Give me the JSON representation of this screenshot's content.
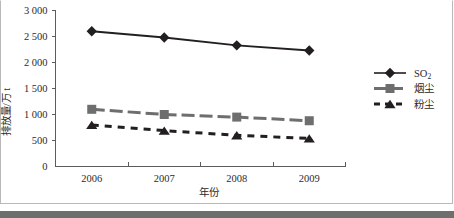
{
  "chart_data": {
    "type": "line",
    "title": "",
    "xlabel": "年份",
    "ylabel": "排放量/万 t",
    "categories": [
      "2006",
      "2007",
      "2008",
      "2009"
    ],
    "ylim": [
      0,
      3000
    ],
    "ytick_labels": [
      "0",
      "500",
      "1 000",
      "1 500",
      "2 000",
      "2 500",
      "3 000"
    ],
    "ytick_values": [
      0,
      500,
      1000,
      1500,
      2000,
      2500,
      3000
    ],
    "grid": false,
    "legend_position": "right",
    "series": [
      {
        "name": "SO2",
        "label": "SO",
        "subscript": "2",
        "marker": "diamond",
        "line_style": "solid",
        "color": "#231f20",
        "values": [
          2600,
          2480,
          2330,
          2230
        ]
      },
      {
        "name": "烟尘",
        "label": "烟尘",
        "subscript": "",
        "marker": "square",
        "line_style": "dashed",
        "color": "#6e6e6e",
        "values": [
          1100,
          1000,
          950,
          880
        ]
      },
      {
        "name": "粉尘",
        "label": "粉尘",
        "subscript": "",
        "marker": "triangle",
        "line_style": "dotted",
        "color": "#231f20",
        "values": [
          800,
          690,
          600,
          540
        ]
      }
    ]
  },
  "colors": {
    "axis": "#5c5c5c",
    "text": "#2b2b2b",
    "series_so2": "#231f20",
    "series_smoke": "#6e6e6e",
    "series_powder": "#231f20",
    "frame": "#b9b9b9",
    "bottom_bar": "#6e6e6e"
  }
}
